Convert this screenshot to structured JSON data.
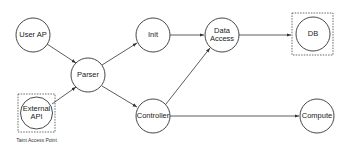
{
  "diagram": {
    "type": "flow-graph",
    "nodes": {
      "user_ap": {
        "label": "User AP"
      },
      "external_api": {
        "label_line1": "External",
        "label_line2": "API"
      },
      "parser": {
        "label": "Parser"
      },
      "init": {
        "label": "Init"
      },
      "controller": {
        "label": "Controller"
      },
      "data_access": {
        "label_line1": "Data",
        "label_line2": "Access"
      },
      "db": {
        "label": "DB"
      },
      "compute": {
        "label": "Compute"
      }
    },
    "edges": [
      {
        "from": "User AP",
        "to": "Parser"
      },
      {
        "from": "External API",
        "to": "Parser"
      },
      {
        "from": "Parser",
        "to": "Init"
      },
      {
        "from": "Parser",
        "to": "Controller"
      },
      {
        "from": "Init",
        "to": "Data Access"
      },
      {
        "from": "Controller",
        "to": "Data Access"
      },
      {
        "from": "Data Access",
        "to": "DB"
      },
      {
        "from": "Controller",
        "to": "Compute"
      }
    ],
    "dashed_boxes": [
      "External API",
      "DB"
    ],
    "caption": "Taint Access Point"
  }
}
